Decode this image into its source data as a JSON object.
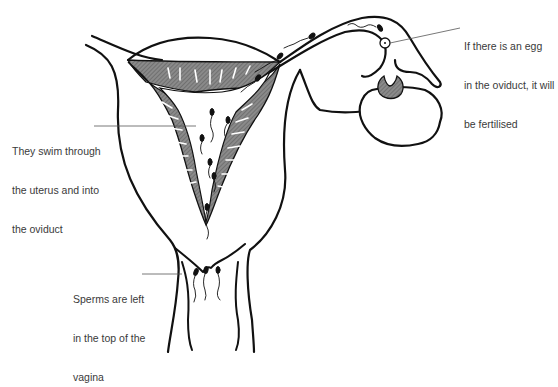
{
  "diagram": {
    "colors": {
      "outline": "#111111",
      "shading": "#7a7a7a",
      "leader_line": "#555555",
      "text": "#3a3a3a",
      "background": "#ffffff"
    },
    "labels": [
      {
        "id": "egg",
        "lines": [
          "If there is an egg",
          "in the oviduct, it will",
          "be fertilised"
        ]
      },
      {
        "id": "uterus",
        "lines": [
          "They swim through",
          "the uterus and into",
          "the oviduct"
        ]
      },
      {
        "id": "vagina",
        "lines": [
          "Sperms are left",
          "in the top of the",
          "vagina"
        ]
      }
    ],
    "parts": [
      "uterus",
      "uterine lining",
      "oviduct",
      "ovary",
      "egg",
      "follicle",
      "cervix",
      "vagina",
      "sperm"
    ]
  }
}
